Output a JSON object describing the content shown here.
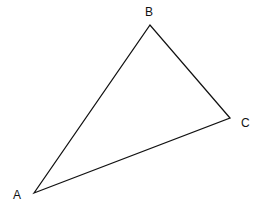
{
  "diagram": {
    "type": "triangle",
    "stroke_color": "#111111",
    "vertices": [
      {
        "label": "A",
        "x": 34,
        "y": 193,
        "label_x": 13,
        "label_y": 199
      },
      {
        "label": "B",
        "x": 150,
        "y": 25,
        "label_x": 145,
        "label_y": 16
      },
      {
        "label": "C",
        "x": 230,
        "y": 118,
        "label_x": 241,
        "label_y": 127
      }
    ]
  }
}
